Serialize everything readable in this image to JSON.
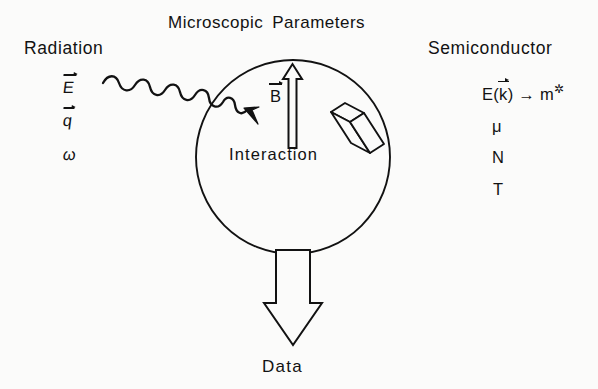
{
  "figure": {
    "title_words": [
      "Microscopic",
      "Parameters"
    ],
    "background_color": "#fbfbfa",
    "ink_color": "#121212"
  },
  "left_column": {
    "heading": "Radiation",
    "symbols": [
      {
        "label": "E",
        "vector": true,
        "text": "E⃗"
      },
      {
        "label": "q",
        "vector": true,
        "text": "q⃗"
      },
      {
        "label": "omega",
        "vector": false,
        "text": "ω"
      }
    ]
  },
  "right_column": {
    "heading": "Semiconductor",
    "symbols": [
      {
        "label": "band-structure-to-effective-mass",
        "text": "E(k⃗) → m*",
        "parts": {
          "prefix": "E(",
          "vector_symbol": "k",
          "suffix": ")",
          "arrow": "→",
          "target": "m",
          "star": "*"
        }
      },
      {
        "label": "mobility",
        "text": "μ"
      },
      {
        "label": "carrier-density",
        "text": "N"
      },
      {
        "label": "temperature",
        "text": "T"
      }
    ]
  },
  "center": {
    "region_label": "Interaction",
    "magnetic_field_label": "B⃗",
    "magnetic_field_direction": "up",
    "sample_shape": "parallelepiped",
    "circle": {
      "cx": 293,
      "cy": 157,
      "r": 97
    }
  },
  "output": {
    "arrow_direction": "down",
    "label": "Data"
  },
  "incoming": {
    "wave_label": "incident-radiation-wave",
    "arrow_direction": "into-circle"
  }
}
